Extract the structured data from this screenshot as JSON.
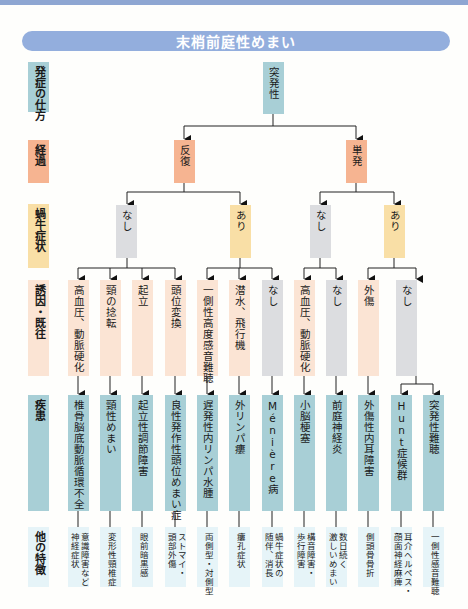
{
  "header": {
    "title": "末梢前庭性めまい"
  },
  "colors": {
    "title_bar": "#93aedd",
    "onset": "#a8cfd6",
    "course": "#f6b491",
    "cochlear_yes": "#f9dfa6",
    "none": "#dcdde0",
    "trigger": "#fbe4d4",
    "disease": "#a8cfd6",
    "features": "#e6f4f8"
  },
  "row_labels": {
    "onset": "発症の仕方",
    "course": "経過",
    "cochlear": "蝸牛症状",
    "trigger": "誘因・既往",
    "disease": "疾患",
    "features": "他の特徴"
  },
  "tree": {
    "onset": "突発性",
    "course": {
      "recurrent": "反復",
      "single": "単発"
    },
    "cochlear": {
      "recurrent_no": "なし",
      "recurrent_yes": "あり",
      "single_no": "なし",
      "single_yes": "あり"
    }
  },
  "columns": [
    {
      "trigger": "高血圧、動脈硬化",
      "disease": "椎骨脳底動脈循環不全",
      "features": "意識障害など\n神経症状"
    },
    {
      "trigger": "頸の捻転",
      "disease": "頸性めまい",
      "features": "変形性頸椎症"
    },
    {
      "trigger": "起立",
      "disease": "起立性調節障害",
      "features": "眼前暗黒感"
    },
    {
      "trigger": "頭位変換",
      "disease": "良性発作性頭位めまい症",
      "features": "ストマイ・\n頭部外傷"
    },
    {
      "trigger": "一側性高度感音難聴",
      "disease": "遅発性内リンパ水腫",
      "features": "両側型・対側型"
    },
    {
      "trigger": "潜水、飛行機",
      "disease": "外リンパ瘻",
      "features": "瘻孔症状"
    },
    {
      "trigger": "なし",
      "disease": "Ménière病",
      "features": "蝸牛症状の\n随伴、消長"
    },
    {
      "trigger": "高血圧、動脈硬化",
      "disease": "小脳梗塞",
      "features": "構音障害・\n歩行障害"
    },
    {
      "trigger": "なし",
      "disease": "前庭神経炎",
      "features": "数日続く\n激しいめまい"
    },
    {
      "trigger": "外傷",
      "disease": "外傷性内耳障害",
      "features": "側頭骨骨折"
    },
    {
      "trigger": "なし",
      "disease": "Hunt症候群",
      "features": "耳介ヘルペス・\n顔面神経麻痺"
    },
    {
      "trigger": "",
      "disease": "突発性難聴",
      "features": "一側性感音難聴"
    }
  ]
}
